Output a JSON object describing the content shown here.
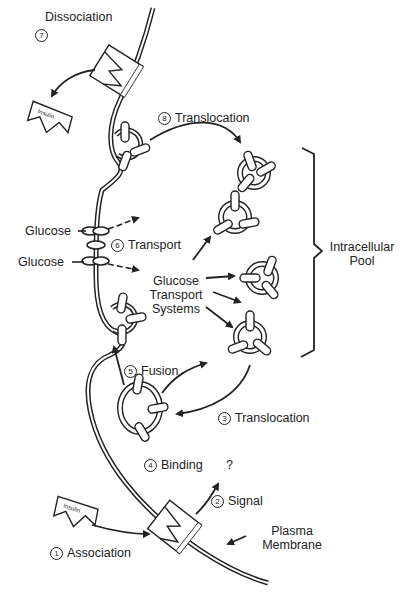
{
  "diagram": {
    "type": "insulin-glucose-transport-mechanism",
    "steps": [
      {
        "number": "1",
        "symbol": "①",
        "label": "Association"
      },
      {
        "number": "2",
        "symbol": "②",
        "label": "Signal"
      },
      {
        "number": "3",
        "symbol": "③",
        "label": "Translocation"
      },
      {
        "number": "4",
        "symbol": "④",
        "label": "Binding"
      },
      {
        "number": "5",
        "symbol": "⑤",
        "label": "Fusion"
      },
      {
        "number": "6",
        "symbol": "⑥",
        "label": "Transport"
      },
      {
        "number": "7",
        "symbol": "⑦",
        "label": "Dissociation"
      },
      {
        "number": "8",
        "symbol": "⑧",
        "label": "Translocation"
      }
    ],
    "labels": {
      "glucose_top": "Glucose",
      "glucose_bottom": "Glucose",
      "gts_line1": "Glucose",
      "gts_line2": "Transport",
      "gts_line3": "Systems",
      "pool_line1": "Intracellular",
      "pool_line2": "Pool",
      "membrane_line1": "Plasma",
      "membrane_line2": "Membrane",
      "signal_target": "?",
      "insulin_top": "Insulin",
      "insulin_bottom": "Insulin"
    },
    "colors": {
      "line": "#222222",
      "background": "#ffffff"
    }
  }
}
